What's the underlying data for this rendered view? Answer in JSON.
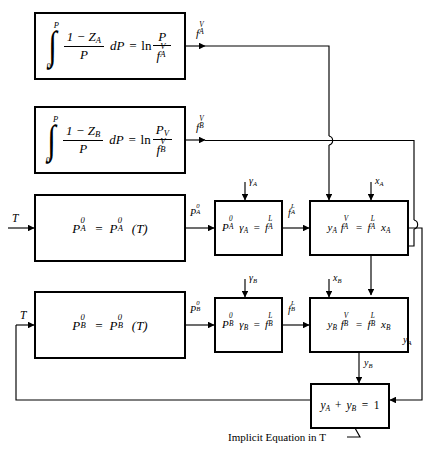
{
  "diagram": {
    "caption": "Implicit Equation in T",
    "caption_var": "T",
    "line_color": "#000000",
    "box_border_color": "#000000",
    "background": "#ffffff"
  },
  "boxes": [
    {
      "id": "box-integral-a",
      "name": "integral-equation-a-box",
      "equation_text": "∫₀^P (1 - Z_A)/P dP = ln(P / f_A^V)",
      "parts": {
        "integral_lower": "0",
        "integral_upper": "P",
        "numerator": "1 − Z",
        "numerator_sub": "A",
        "denominator": "P",
        "differential": "dP",
        "equals": "=",
        "log": "ln",
        "rhs_num": "P",
        "rhs_den": "f",
        "rhs_den_sub": "A",
        "rhs_den_sup": "V"
      }
    },
    {
      "id": "box-integral-b",
      "name": "integral-equation-b-box",
      "equation_text": "∫₀^P (1 - Z_B)/P dP = ln(P_V / f_B^V)",
      "parts": {
        "integral_lower": "0",
        "integral_upper": "P",
        "numerator": "1 − Z",
        "numerator_sub": "B",
        "denominator": "P",
        "differential": "dP",
        "equals": "=",
        "log": "ln",
        "rhs_num": "P",
        "rhs_num_sub": "V",
        "rhs_den": "f",
        "rhs_den_sub": "B",
        "rhs_den_sup": "V"
      }
    },
    {
      "id": "box-pa0",
      "name": "vapor-pressure-a-box",
      "equation_text": "P_A⁰ = P_A⁰(T)",
      "parts": {
        "lhs": "P",
        "lhs_sub": "A",
        "lhs_sup": "0",
        "equals": "=",
        "rhs": "P",
        "rhs_sub": "A",
        "rhs_sup": "0",
        "arg": "(T)"
      }
    },
    {
      "id": "box-pb0",
      "name": "vapor-pressure-b-box",
      "equation_text": "P_B⁰ = P_B⁰(T)",
      "parts": {
        "lhs": "P",
        "lhs_sub": "B",
        "lhs_sup": "0",
        "equals": "=",
        "rhs": "P",
        "rhs_sub": "B",
        "rhs_sup": "0",
        "arg": "(T)"
      }
    },
    {
      "id": "box-gamma-a",
      "name": "activity-coefficient-a-box",
      "equation_text": "P_A⁰ γ_A = f_A^L",
      "parts": {
        "p": "P",
        "p_sub": "A",
        "p_sup": "0",
        "gamma": "γ",
        "gamma_sub": "A",
        "equals": "=",
        "f": "f",
        "f_sub": "A",
        "f_sup": "L"
      }
    },
    {
      "id": "box-gamma-b",
      "name": "activity-coefficient-b-box",
      "equation_text": "P_B⁰ γ_B = f_B^L",
      "parts": {
        "p": "P",
        "p_sub": "B",
        "p_sup": "0",
        "gamma": "γ",
        "gamma_sub": "B",
        "equals": "=",
        "f": "f",
        "f_sub": "B",
        "f_sup": "L"
      }
    },
    {
      "id": "box-equil-a",
      "name": "equilibrium-a-box",
      "equation_text": "y_A f_A^V = f_A^L x_A",
      "parts": {
        "y": "y",
        "y_sub": "A",
        "fv": "f",
        "fv_sub": "A",
        "fv_sup": "V",
        "equals": "=",
        "fl": "f",
        "fl_sub": "A",
        "fl_sup": "L",
        "x": "x",
        "x_sub": "A"
      }
    },
    {
      "id": "box-equil-b",
      "name": "equilibrium-b-box",
      "equation_text": "y_B f_B^V = f_B^L x_B",
      "parts": {
        "y": "y",
        "y_sub": "B",
        "fv": "f",
        "fv_sub": "B",
        "fv_sup": "V",
        "equals": "=",
        "fl": "f",
        "fl_sub": "B",
        "fl_sup": "L",
        "x": "x",
        "x_sub": "B"
      }
    },
    {
      "id": "box-sum",
      "name": "mole-fraction-sum-box",
      "equation_text": "y_A + y_B = 1",
      "parts": {
        "ya": "y",
        "ya_sub": "A",
        "plus": "+",
        "yb": "y",
        "yb_sub": "B",
        "equals": "=",
        "one": "1"
      }
    }
  ],
  "stream_labels": [
    {
      "id": "lbl-fav",
      "name": "stream-label-fav",
      "text": "f_A^V",
      "base": "f",
      "sub": "A",
      "sup": "V"
    },
    {
      "id": "lbl-fbv",
      "name": "stream-label-fbv",
      "text": "f_B^V",
      "base": "f",
      "sub": "B",
      "sup": "V"
    },
    {
      "id": "lbl-t1",
      "name": "input-label-temperature-top",
      "text": "T",
      "base": "T",
      "sub": "",
      "sup": ""
    },
    {
      "id": "lbl-t2",
      "name": "input-label-temperature-bottom",
      "text": "T",
      "base": "T",
      "sub": "",
      "sup": ""
    },
    {
      "id": "lbl-pa0",
      "name": "stream-label-pa0",
      "text": "P_A⁰",
      "base": "P",
      "sub": "A",
      "sup": "0"
    },
    {
      "id": "lbl-pb0",
      "name": "stream-label-pb0",
      "text": "P_B⁰",
      "base": "P",
      "sub": "B",
      "sup": "0"
    },
    {
      "id": "lbl-gammaa",
      "name": "input-label-gamma-a",
      "text": "γ_A",
      "base": "γ",
      "sub": "A",
      "sup": ""
    },
    {
      "id": "lbl-gammab",
      "name": "input-label-gamma-b",
      "text": "γ_B",
      "base": "γ",
      "sub": "B",
      "sup": ""
    },
    {
      "id": "lbl-fal",
      "name": "stream-label-fal",
      "text": "f_A^L",
      "base": "f",
      "sub": "A",
      "sup": "L"
    },
    {
      "id": "lbl-fbl",
      "name": "stream-label-fbl",
      "text": "f_B^L",
      "base": "f",
      "sub": "B",
      "sup": "L"
    },
    {
      "id": "lbl-xa",
      "name": "input-label-xa",
      "text": "x_A",
      "base": "x",
      "sub": "A",
      "sup": ""
    },
    {
      "id": "lbl-xb",
      "name": "input-label-xb",
      "text": "x_B",
      "base": "x",
      "sub": "B",
      "sup": ""
    },
    {
      "id": "lbl-ya",
      "name": "stream-label-ya",
      "text": "y_A",
      "base": "y",
      "sub": "A",
      "sup": ""
    },
    {
      "id": "lbl-yb",
      "name": "stream-label-yb",
      "text": "y_B",
      "base": "y",
      "sub": "B",
      "sup": ""
    }
  ]
}
